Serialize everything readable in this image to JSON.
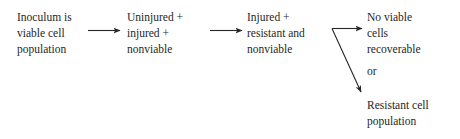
{
  "diagram": {
    "type": "flowchart",
    "orientation": "left-to-right",
    "background_color": "#ffffff",
    "text_color": "#262626",
    "nodes": [
      {
        "id": "node-1",
        "name": "inoculum-node",
        "lines": [
          "Inoculum is",
          "viable cell",
          "population"
        ]
      },
      {
        "id": "node-2",
        "name": "uninjured-injured-nonviable-node",
        "lines": [
          "Uninjured +",
          "injured +",
          "nonviable"
        ]
      },
      {
        "id": "node-3",
        "name": "injured-resistant-nonviable-node",
        "lines": [
          "Injured +",
          "resistant and",
          "nonviable"
        ]
      },
      {
        "id": "node-4",
        "name": "no-viable-cells-node",
        "lines": [
          "No viable",
          "cells",
          "recoverable"
        ]
      },
      {
        "id": "node-5",
        "name": "resistant-cell-population-node",
        "lines": [
          "Resistant cell",
          "population"
        ]
      }
    ],
    "or_label": "or",
    "arrows": [
      {
        "name": "arrow-inoculum-to-uninjured",
        "from": "node-1",
        "to": "node-2",
        "style": "straight-horizontal"
      },
      {
        "name": "arrow-uninjured-to-injured",
        "from": "node-2",
        "to": "node-3",
        "style": "straight-horizontal"
      },
      {
        "name": "arrow-injured-to-no-viable-cells",
        "from": "node-3",
        "to": "node-4",
        "style": "branch-horizontal"
      },
      {
        "name": "arrow-injured-to-resistant-population",
        "from": "node-3",
        "to": "node-5",
        "style": "branch-diagonal-down"
      }
    ]
  }
}
